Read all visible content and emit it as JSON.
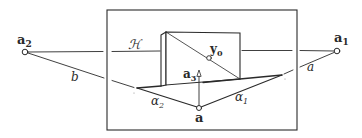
{
  "diagram": {
    "type": "geometric-projection-diagram",
    "colors": {
      "stroke": "#2a2a2a",
      "background": "#ffffff"
    },
    "frame": {
      "x": 107,
      "y": 10,
      "width": 190,
      "height": 120
    },
    "points": {
      "a2": {
        "label_main": "a",
        "label_sub": "2",
        "x": 25,
        "y": 52
      },
      "a1": {
        "label_main": "a",
        "label_sub": "1",
        "x": 337,
        "y": 51
      },
      "y0": {
        "label_main": "y",
        "label_sub": "0",
        "x": 209,
        "y": 58
      },
      "a3": {
        "label_main": "a",
        "label_sub": "3",
        "x": 199,
        "y": 72
      },
      "a": {
        "label_main": "a",
        "x": 199,
        "y": 108
      }
    },
    "line_labels": {
      "H": "ℋ",
      "b": "b",
      "a": "a",
      "alpha1_main": "α",
      "alpha1_sub": "1",
      "alpha2_main": "α",
      "alpha2_sub": "2"
    }
  }
}
